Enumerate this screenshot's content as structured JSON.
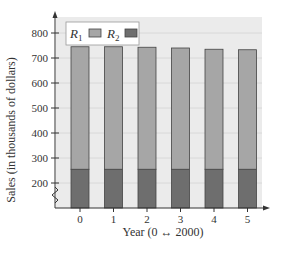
{
  "chart_data": {
    "type": "bar",
    "stacked": true,
    "title": "",
    "xlabel": "Year (0 ↔ 2000)",
    "ylabel": "Sales (in thousands of dollars)",
    "categories": [
      "0",
      "1",
      "2",
      "3",
      "4",
      "5"
    ],
    "series": [
      {
        "name": "R1",
        "values": [
          490,
          490,
          488,
          485,
          480,
          478
        ],
        "color": "#a6a6a6"
      },
      {
        "name": "R2",
        "values": [
          255,
          255,
          255,
          255,
          255,
          255
        ],
        "color": "#6e6e6e"
      }
    ],
    "totals": [
      745,
      745,
      743,
      740,
      735,
      733
    ],
    "ylim": [
      100,
      850
    ],
    "yticks": [
      200,
      300,
      400,
      500,
      600,
      700,
      800
    ],
    "grid": true,
    "y_axis_break": true,
    "legend": {
      "position": "top-left",
      "entries": [
        "R1",
        "R2"
      ]
    },
    "colors": {
      "background": "#ebebeb",
      "grid": "#d8d8d8",
      "axis": "#333333",
      "bar_outline": "#444444"
    }
  },
  "legend": {
    "r1": {
      "label": "R",
      "sub": "1"
    },
    "r2": {
      "label": "R",
      "sub": "2"
    }
  },
  "axes": {
    "xlabel": "Year (0 ↔ 2000)",
    "ylabel": "Sales (in thousands of dollars)",
    "yticks": [
      "800",
      "700",
      "600",
      "500",
      "400",
      "300",
      "200"
    ],
    "xticks": [
      "0",
      "1",
      "2",
      "3",
      "4",
      "5"
    ]
  }
}
